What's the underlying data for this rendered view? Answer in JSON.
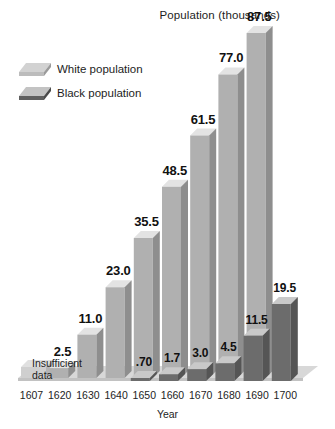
{
  "title": "Population (thousands)",
  "axis": {
    "x_title": "Year",
    "x_ticks": [
      "1607",
      "1620",
      "1630",
      "1640",
      "1650",
      "1660",
      "1670",
      "1680",
      "1690",
      "1700"
    ]
  },
  "legend": {
    "items": [
      {
        "label": "White population",
        "swatch": "light-slab-icon",
        "color": "#c9c9c9"
      },
      {
        "label": "Black population",
        "swatch": "dark-slab-icon",
        "color": "#6e6e6e"
      }
    ]
  },
  "notes": {
    "insufficient_line1": "Insufficient",
    "insufficient_line2": "data"
  },
  "labels": {
    "white": [
      "2.5",
      "11.0",
      "23.0",
      "35.5",
      "48.5",
      "61.5",
      "77.0",
      "87.5"
    ],
    "black": [
      ".70",
      "1.7",
      "3.0",
      "4.5",
      "11.5",
      "19.5"
    ]
  },
  "chart_data": {
    "type": "bar",
    "title": "Population (thousands)",
    "xlabel": "Year",
    "ylabel": "Population (thousands)",
    "categories": [
      "1607",
      "1620",
      "1630",
      "1640",
      "1650",
      "1660",
      "1670",
      "1680",
      "1690",
      "1700"
    ],
    "ylim": [
      0,
      87.5
    ],
    "grid": false,
    "legend_position": "upper-left",
    "series": [
      {
        "name": "White population",
        "color": "#b4b4b4",
        "values": [
          null,
          2.5,
          11.0,
          23.0,
          35.5,
          48.5,
          61.5,
          77.0,
          87.5,
          null
        ],
        "value_labels": [
          "Insufficient data",
          "2.5",
          "11.0",
          "23.0",
          "35.5",
          "48.5",
          "61.5",
          "77.0",
          "87.5",
          ""
        ],
        "note": "Values run 1620-1700 in the rendered figure; 1607 is marked Insufficient data"
      },
      {
        "name": "Black population",
        "color": "#6e6e6e",
        "values": [
          null,
          null,
          null,
          null,
          0.7,
          1.7,
          3.0,
          4.5,
          11.5,
          19.5
        ],
        "value_labels": [
          "",
          "",
          "",
          "",
          ".70",
          "1.7",
          "3.0",
          "4.5",
          "11.5",
          "19.5"
        ]
      }
    ]
  }
}
